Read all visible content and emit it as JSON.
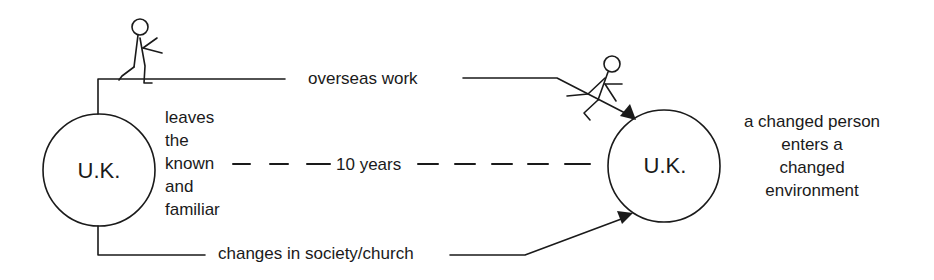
{
  "diagram": {
    "title": "",
    "nodes": [
      {
        "id": "uk_start",
        "label": "U.K."
      },
      {
        "id": "uk_end",
        "label": "U.K."
      }
    ],
    "edges": [
      {
        "from": "uk_start",
        "to": "uk_end",
        "label": "overseas work",
        "style": "solid",
        "arrow": true
      },
      {
        "from": "uk_start",
        "to": "uk_end",
        "label": "10 years",
        "style": "dashed",
        "arrow": false
      },
      {
        "from": "uk_start",
        "to": "uk_end",
        "label": "changes in society/church",
        "style": "solid",
        "arrow": true
      }
    ],
    "left_annotation": [
      "leaves",
      "the",
      "known",
      "and",
      "familiar"
    ],
    "right_annotation": [
      "a changed person",
      "enters a",
      "changed",
      "environment"
    ],
    "figures": [
      {
        "name": "stick-figure-departing",
        "pose": "walking away from U.K."
      },
      {
        "name": "stick-figure-returning",
        "pose": "sliding down toward U.K."
      }
    ],
    "colors": {
      "stroke": "#1a1a1a",
      "background": "#ffffff"
    }
  }
}
